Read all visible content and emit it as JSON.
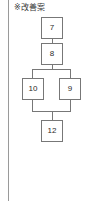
{
  "panel": {
    "width": 89,
    "height": 201,
    "background": "#ffffff",
    "divider_color": "#9a9a9a",
    "node_border_color": "#777777",
    "node_fill_color": "#ffffff",
    "text_color": "#2b2b2b"
  },
  "caption": {
    "text": "※改善案"
  },
  "chart_data": {
    "type": "diagram",
    "title": "※改善案",
    "nodes": [
      {
        "id": "n7",
        "label": "7",
        "x": 41,
        "y": 17,
        "w": 22,
        "h": 22
      },
      {
        "id": "n8",
        "label": "8",
        "x": 41,
        "y": 43,
        "w": 22,
        "h": 22
      },
      {
        "id": "n10",
        "label": "10",
        "x": 22,
        "y": 78,
        "w": 22,
        "h": 22
      },
      {
        "id": "n9",
        "label": "9",
        "x": 59,
        "y": 78,
        "w": 22,
        "h": 22
      },
      {
        "id": "n12",
        "label": "12",
        "x": 41,
        "y": 120,
        "w": 22,
        "h": 22
      }
    ],
    "edges": [
      {
        "from": "n7",
        "to": "n8"
      },
      {
        "from": "n8",
        "to": "n10"
      },
      {
        "from": "n8",
        "to": "n9"
      },
      {
        "from": "n10",
        "to": "n12"
      },
      {
        "from": "n9",
        "to": "n12"
      }
    ],
    "segments": [
      {
        "id": "seg-7-8",
        "orient": "v",
        "x": 52,
        "y": 39,
        "len": 4
      },
      {
        "id": "seg-8-down",
        "orient": "v",
        "x": 52,
        "y": 65,
        "len": 5
      },
      {
        "id": "seg-split-bus",
        "orient": "h",
        "x": 32,
        "y": 69,
        "len": 39
      },
      {
        "id": "seg-to-10",
        "orient": "v",
        "x": 32,
        "y": 69,
        "len": 9
      },
      {
        "id": "seg-to-9",
        "orient": "v",
        "x": 70,
        "y": 69,
        "len": 9
      },
      {
        "id": "seg-from-10",
        "orient": "v",
        "x": 32,
        "y": 100,
        "len": 11
      },
      {
        "id": "seg-from-9",
        "orient": "v",
        "x": 70,
        "y": 100,
        "len": 11
      },
      {
        "id": "seg-merge-bus",
        "orient": "h",
        "x": 32,
        "y": 111,
        "len": 39
      },
      {
        "id": "seg-to-12",
        "orient": "v",
        "x": 52,
        "y": 111,
        "len": 9
      }
    ]
  }
}
